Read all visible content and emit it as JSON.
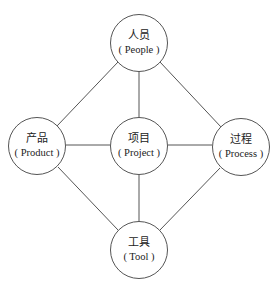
{
  "diagram": {
    "type": "network",
    "line_color": "#555555",
    "nodes": [
      {
        "id": "people",
        "zh": "人员",
        "en": "( People )",
        "x": 139,
        "y": 43
      },
      {
        "id": "product",
        "zh": "产品",
        "en": "( Product )",
        "x": 37,
        "y": 146
      },
      {
        "id": "project",
        "zh": "项目",
        "en": "( Project )",
        "x": 139,
        "y": 146
      },
      {
        "id": "process",
        "zh": "过程",
        "en": "( Process )",
        "x": 241,
        "y": 147
      },
      {
        "id": "tool",
        "zh": "工具",
        "en": "( Tool )",
        "x": 139,
        "y": 250
      }
    ],
    "edges": [
      {
        "from": "people",
        "to": "project"
      },
      {
        "from": "people",
        "to": "product"
      },
      {
        "from": "people",
        "to": "process"
      },
      {
        "from": "product",
        "to": "project"
      },
      {
        "from": "project",
        "to": "process"
      },
      {
        "from": "project",
        "to": "tool"
      },
      {
        "from": "product",
        "to": "tool"
      },
      {
        "from": "process",
        "to": "tool"
      }
    ]
  }
}
